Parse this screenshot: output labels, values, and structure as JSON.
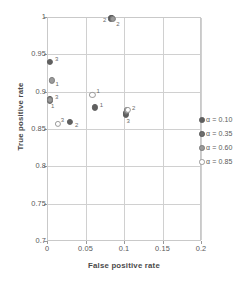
{
  "chart_data": {
    "type": "scatter",
    "title": "",
    "xlabel": "False positive rate",
    "ylabel": "True positive rate",
    "xlim": [
      0,
      0.2
    ],
    "ylim": [
      0.7,
      1
    ],
    "xticks": [
      "0",
      "0.05",
      "0.1",
      "0.15",
      "0.2"
    ],
    "xtick_values": [
      0,
      0.05,
      0.1,
      0.15,
      0.2
    ],
    "yticks": [
      "0.7",
      "0.75",
      "0.8",
      "0.85",
      "0.9",
      "0.95",
      "1"
    ],
    "ytick_values": [
      0.7,
      0.75,
      0.8,
      0.85,
      0.9,
      0.95,
      1
    ],
    "grid": true,
    "legend_position": "right",
    "series": [
      {
        "name": "α = 0.10",
        "swatch": "s1",
        "color": "#5f5f5f",
        "points": [
          {
            "x": 0.004,
            "y": 0.888,
            "label": "1",
            "label_dx": 1,
            "label_dy": 5
          },
          {
            "x": 0.062,
            "y": 0.879,
            "label": "1",
            "label_dx": 5,
            "label_dy": -2
          },
          {
            "x": 0.083,
            "y": 0.998,
            "label": "2",
            "label_dx": -8,
            "label_dy": 2
          },
          {
            "x": 0.03,
            "y": 0.859,
            "label": "2",
            "label_dx": 5,
            "label_dy": 3
          },
          {
            "x": 0.004,
            "y": 0.94,
            "label": "3",
            "label_dx": 5,
            "label_dy": -3
          },
          {
            "x": 0.102,
            "y": 0.869,
            "label": "3",
            "label_dx": 1,
            "label_dy": 6
          }
        ]
      },
      {
        "name": "α = 0.35",
        "swatch": "s2",
        "color": "#6e6e6e",
        "points": [
          {
            "x": 0.004,
            "y": 0.89,
            "label": "",
            "label_dx": 0,
            "label_dy": 0
          },
          {
            "x": 0.084,
            "y": 0.999,
            "label": "",
            "label_dx": 0,
            "label_dy": 0
          },
          {
            "x": 0.103,
            "y": 0.872,
            "label": "",
            "label_dx": 0,
            "label_dy": 0
          }
        ]
      },
      {
        "name": "α = 0.60",
        "swatch": "s3",
        "color": "#9a9a9a",
        "points": [
          {
            "x": 0.006,
            "y": 0.915,
            "label": "1",
            "label_dx": 4,
            "label_dy": 4
          },
          {
            "x": 0.086,
            "y": 0.997,
            "label": "2",
            "label_dx": 3,
            "label_dy": 5
          },
          {
            "x": 0.104,
            "y": 0.875,
            "label": "2",
            "label_dx": 5,
            "label_dy": -2
          },
          {
            "x": 0.004,
            "y": 0.889,
            "label": "3",
            "label_dx": 5,
            "label_dy": -3
          }
        ]
      },
      {
        "name": "α = 0.85",
        "swatch": "s4",
        "color": "#ffffff",
        "points": [
          {
            "x": 0.059,
            "y": 0.896,
            "label": "1",
            "label_dx": 4,
            "label_dy": -4
          },
          {
            "x": 0.014,
            "y": 0.857,
            "label": "3",
            "label_dx": 3,
            "label_dy": -4
          },
          {
            "x": 0.105,
            "y": 0.876,
            "label": "",
            "label_dx": 0,
            "label_dy": 0
          }
        ]
      }
    ]
  },
  "legend": {
    "items": [
      {
        "label": "α = 0.10",
        "swatch": "s1"
      },
      {
        "label": "α = 0.35",
        "swatch": "s2"
      },
      {
        "label": "α = 0.60",
        "swatch": "s3"
      },
      {
        "label": "α = 0.85",
        "swatch": "s4"
      }
    ]
  }
}
